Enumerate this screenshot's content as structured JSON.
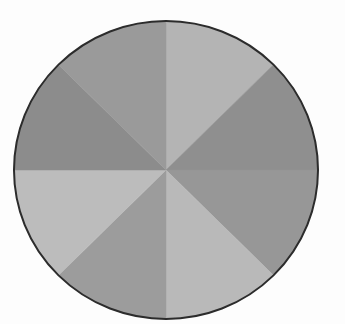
{
  "figure": {
    "background_color": "#fdfdfd",
    "outline_color": "#2c2c2c",
    "outline_width": 2,
    "center_x": 166,
    "center_y": 170,
    "radius_x": 152,
    "radius_y": 149
  },
  "scan_artifacts": {
    "top": "",
    "middle": "",
    "bottom": ""
  },
  "chart_data": {
    "type": "pie",
    "title": "",
    "subtitle": "",
    "xlabel": "",
    "ylabel": "",
    "grid": false,
    "legend": "none",
    "total_slices": 8,
    "slice_angle_degrees": 45,
    "start_angle_degrees": -90,
    "direction": "clockwise",
    "labels": [
      "Slice 1",
      "Slice 2",
      "Slice 3",
      "Slice 4",
      "Slice 5",
      "Slice 6",
      "Slice 7",
      "Slice 8"
    ],
    "values": [
      12.5,
      12.5,
      12.5,
      12.5,
      12.5,
      12.5,
      12.5,
      12.5
    ],
    "percentages": [
      "12.5%",
      "12.5%",
      "12.5%",
      "12.5%",
      "12.5%",
      "12.5%",
      "12.5%",
      "12.5%"
    ],
    "colors": [
      "#b4b4b4",
      "#8f8f8f",
      "#979797",
      "#b9b9b9",
      "#9c9c9c",
      "#bcbcbc",
      "#8c8c8c",
      "#9a9a9a"
    ],
    "slices": [
      {
        "label": "Slice 1",
        "value": 12.5,
        "percent": "12.5%",
        "start_deg": -90,
        "end_deg": -45,
        "color": "#b4b4b4",
        "position": "top-right"
      },
      {
        "label": "Slice 2",
        "value": 12.5,
        "percent": "12.5%",
        "start_deg": -45,
        "end_deg": 0,
        "color": "#8f8f8f",
        "position": "right-upper"
      },
      {
        "label": "Slice 3",
        "value": 12.5,
        "percent": "12.5%",
        "start_deg": 0,
        "end_deg": 45,
        "color": "#979797",
        "position": "right-lower"
      },
      {
        "label": "Slice 4",
        "value": 12.5,
        "percent": "12.5%",
        "start_deg": 45,
        "end_deg": 90,
        "color": "#b9b9b9",
        "position": "bottom-right"
      },
      {
        "label": "Slice 5",
        "value": 12.5,
        "percent": "12.5%",
        "start_deg": 90,
        "end_deg": 135,
        "color": "#9c9c9c",
        "position": "bottom-left"
      },
      {
        "label": "Slice 6",
        "value": 12.5,
        "percent": "12.5%",
        "start_deg": 135,
        "end_deg": 180,
        "color": "#bcbcbc",
        "position": "left-lower"
      },
      {
        "label": "Slice 7",
        "value": 12.5,
        "percent": "12.5%",
        "start_deg": 180,
        "end_deg": 225,
        "color": "#8c8c8c",
        "position": "left-upper"
      },
      {
        "label": "Slice 8",
        "value": 12.5,
        "percent": "12.5%",
        "start_deg": 225,
        "end_deg": 270,
        "color": "#9a9a9a",
        "position": "top-left"
      }
    ]
  }
}
